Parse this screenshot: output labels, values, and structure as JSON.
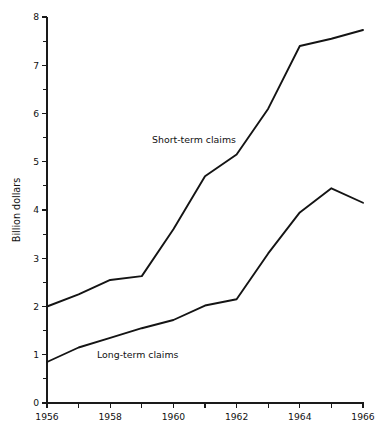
{
  "chart_data": {
    "type": "line",
    "title": "",
    "subtitle": "",
    "xlabel": "",
    "ylabel": "Billion dollars",
    "xlim": [
      1956,
      1966
    ],
    "ylim": [
      0,
      8
    ],
    "grid": false,
    "legend_position": "inline-annotation",
    "x": [
      1956,
      1957,
      1958,
      1959,
      1960,
      1961,
      1962,
      1963,
      1964,
      1965,
      1966
    ],
    "y_major_ticks": [
      0,
      1,
      2,
      3,
      4,
      5,
      6,
      7,
      8
    ],
    "y_minor_ticks": [
      0.5,
      1.5,
      2.5,
      3.5,
      4.5,
      5.5,
      6.5,
      7.5
    ],
    "y_tick_labels": [
      "0",
      "1",
      "2",
      "3",
      "4",
      "5",
      "6",
      "7",
      "8"
    ],
    "x_tick_values": [
      1956,
      1957,
      1958,
      1959,
      1960,
      1961,
      1962,
      1963,
      1964,
      1965,
      1966
    ],
    "x_tick_labels": [
      "1956",
      "",
      "1958",
      "",
      "1960",
      "",
      "1962",
      "",
      "1964",
      "",
      "1966"
    ],
    "x_labeled_years": [
      "1956",
      "1958",
      "1960",
      "1962",
      "1964",
      "1966"
    ],
    "series": [
      {
        "name": "Short-term claims",
        "label": "Short-term claims",
        "color": "#141414",
        "values": [
          2.0,
          2.25,
          2.55,
          2.63,
          3.6,
          4.7,
          5.15,
          6.1,
          7.4,
          7.55,
          7.73
        ],
        "annotation": {
          "text": "Short-term claims",
          "x_px": 152,
          "y_px": 143
        }
      },
      {
        "name": "Long-term claims",
        "label": "Long-term claims",
        "color": "#141414",
        "values": [
          0.85,
          1.15,
          1.35,
          1.55,
          1.72,
          2.02,
          2.15,
          3.1,
          3.95,
          4.45,
          4.15
        ],
        "annotation": {
          "text": "Long-term claims",
          "x_px": 97,
          "y_px": 358
        }
      }
    ]
  },
  "axes": {
    "y_axis_title": "Billion dollars",
    "y_labels": [
      "8",
      "7",
      "6",
      "5",
      "4",
      "3",
      "2",
      "1",
      "0"
    ],
    "x_labels": [
      "1956",
      "1958",
      "1960",
      "1962",
      "1964",
      "1966"
    ]
  },
  "annotations": {
    "short_term": "Short-term claims",
    "long_term": "Long-term claims"
  },
  "colors": {
    "line": "#141414",
    "axis": "#1a1a1a",
    "text": "#111111",
    "background": "#ffffff"
  }
}
